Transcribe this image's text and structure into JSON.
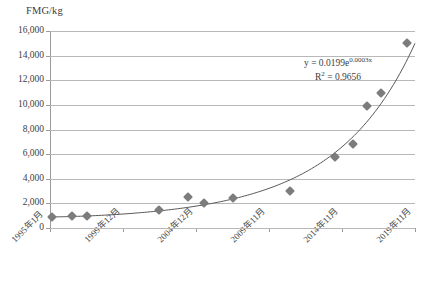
{
  "chart_data": {
    "type": "scatter",
    "title": "",
    "ylabel": "FMG/kg",
    "xlabel": "",
    "ylim": [
      0,
      16000
    ],
    "grid": true,
    "legend": "none",
    "ytick_labels": [
      "16,000",
      "14,000",
      "12,000",
      "10,000",
      "8,000",
      "6,000",
      "4,000",
      "2,000",
      "0"
    ],
    "ytick_values": [
      16000,
      14000,
      12000,
      10000,
      8000,
      6000,
      4000,
      2000,
      0
    ],
    "xtick_labels": [
      "1995年1月",
      "1999年12月",
      "2004年12月",
      "2009年11月",
      "2014年11月",
      "2019年11月"
    ],
    "points": [
      {
        "x": 2,
        "y": 900
      },
      {
        "x": 23,
        "y": 950
      },
      {
        "x": 38,
        "y": 950
      },
      {
        "x": 113,
        "y": 1500
      },
      {
        "x": 144,
        "y": 2500
      },
      {
        "x": 160,
        "y": 2000
      },
      {
        "x": 190,
        "y": 2450
      },
      {
        "x": 250,
        "y": 3000
      },
      {
        "x": 297,
        "y": 5800
      },
      {
        "x": 315,
        "y": 6850
      },
      {
        "x": 330,
        "y": 9900
      },
      {
        "x": 345,
        "y": 11000
      },
      {
        "x": 372,
        "y": 15000
      }
    ],
    "trendline": {
      "type": "exponential",
      "equation_prefix": "y = 0.0199e",
      "equation_exponent": "0.0003x",
      "r_squared_label": "R",
      "r_squared_exponent": "2",
      "r_squared_value": "= 0.9656",
      "coefficient": 0.0199,
      "rate": 0.0003,
      "r_squared": 0.9656
    },
    "marker_color": "#7c7c7c",
    "gridline_color": "#b8b8b8",
    "trendline_color": "#5a5a5a"
  }
}
